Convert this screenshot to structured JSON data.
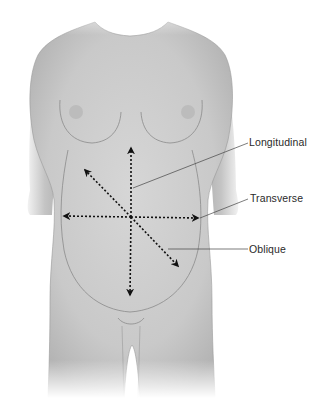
{
  "figure": {
    "labels": [
      {
        "id": "longitudinal",
        "text": "Longitudinal"
      },
      {
        "id": "transverse",
        "text": "Transverse"
      },
      {
        "id": "oblique",
        "text": "Oblique"
      }
    ],
    "colors": {
      "skin": "#cfcfcf",
      "outline": "#8a8a8a",
      "arrow": "#111111",
      "leader": "#444444",
      "text": "#2a2a2a"
    }
  }
}
